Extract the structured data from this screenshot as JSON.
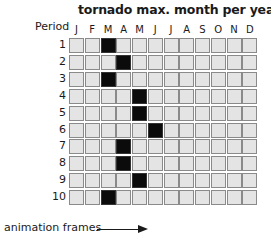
{
  "chart_data": {
    "type": "heatmap",
    "title": "tornado max. month per year",
    "ylabel": "Period",
    "xlabel": "",
    "categories": [
      "J",
      "F",
      "M",
      "A",
      "M",
      "J",
      "J",
      "A",
      "S",
      "O",
      "N",
      "D"
    ],
    "periods": [
      1,
      2,
      3,
      4,
      5,
      6,
      7,
      8,
      9,
      10
    ],
    "max_month_index": [
      3,
      4,
      3,
      5,
      5,
      6,
      4,
      4,
      5,
      3
    ],
    "max_month_name": [
      "March",
      "April",
      "March",
      "May",
      "May",
      "June",
      "April",
      "April",
      "May",
      "March"
    ],
    "annotation": "animation frames",
    "colors": {
      "highlight": "#0b0b0b",
      "cell": "#e4e4e4",
      "border": "#8a8a8a"
    },
    "grid": false,
    "legend": "none"
  },
  "title": "tornado max. month per year",
  "period_label": "Period",
  "months": [
    "J",
    "F",
    "M",
    "A",
    "M",
    "J",
    "J",
    "A",
    "S",
    "O",
    "N",
    "D"
  ],
  "rows": [
    "1",
    "2",
    "3",
    "4",
    "5",
    "6",
    "7",
    "8",
    "9",
    "10"
  ],
  "annotation": "animation frames"
}
